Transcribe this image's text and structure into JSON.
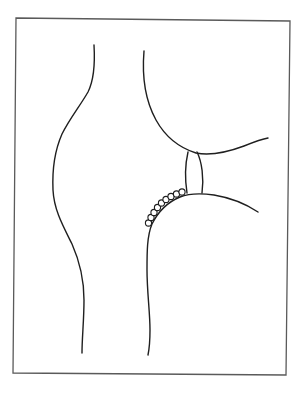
{
  "figure": {
    "type": "line-drawing",
    "colors": {
      "background": "#ffffff",
      "line": "#1f1f1f",
      "frame": "#5a5a5a"
    },
    "frame": {
      "corners": [
        [
          16,
          18
        ],
        [
          290,
          21
        ],
        [
          286,
          375
        ],
        [
          13,
          373
        ]
      ]
    },
    "elements": [
      {
        "name": "left-contour",
        "kind": "curve"
      },
      {
        "name": "upper-bone-contour",
        "kind": "curve"
      },
      {
        "name": "meniscus",
        "kind": "lens"
      },
      {
        "name": "lower-bone-contour",
        "kind": "curve"
      },
      {
        "name": "bead-chain",
        "kind": "circles",
        "count": 9
      }
    ],
    "beads": [
      [
        148.5,
        223
      ],
      [
        151,
        217.5
      ],
      [
        154,
        212.5
      ],
      [
        157.5,
        207.5
      ],
      [
        161.5,
        203
      ],
      [
        166,
        199.5
      ],
      [
        171,
        196.5
      ],
      [
        176.5,
        194
      ],
      [
        182,
        192
      ]
    ]
  }
}
